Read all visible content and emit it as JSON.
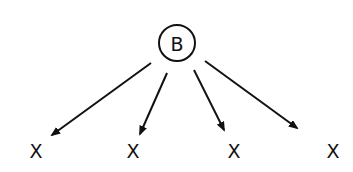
{
  "diagram": {
    "type": "tree",
    "root": {
      "label": "B",
      "shape": "circle",
      "cx": 177,
      "cy": 43,
      "r": 18
    },
    "leaves": [
      {
        "label": "X",
        "x": 36,
        "y": 158
      },
      {
        "label": "X",
        "x": 133,
        "y": 158
      },
      {
        "label": "X",
        "x": 234,
        "y": 158
      },
      {
        "label": "X",
        "x": 333,
        "y": 158
      }
    ],
    "edges": [
      {
        "from": "B",
        "to": 0,
        "x1": 151,
        "y1": 63,
        "x2": 52,
        "y2": 135
      },
      {
        "from": "B",
        "to": 1,
        "x1": 167,
        "y1": 73,
        "x2": 140,
        "y2": 134
      },
      {
        "from": "B",
        "to": 2,
        "x1": 194,
        "y1": 70,
        "x2": 224,
        "y2": 130
      },
      {
        "from": "B",
        "to": 3,
        "x1": 205,
        "y1": 61,
        "x2": 297,
        "y2": 128
      }
    ],
    "colors": {
      "stroke": "#111111",
      "background": "#ffffff"
    }
  }
}
